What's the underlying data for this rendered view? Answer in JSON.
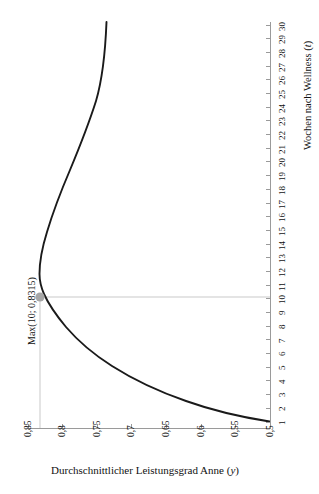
{
  "chart_data": {
    "type": "line",
    "title": "",
    "orientation": "rotated-90",
    "xlabel": "Wochen nach Wellness (t)",
    "ylabel": "Durchschnittlicher Leistungsgrad Anne (y)",
    "xlabel_plain": "Wochen nach Wellness",
    "xlabel_symbol": "t",
    "ylabel_plain": "Durchschnittlicher Leistungsgrad Anne",
    "ylabel_symbol": "y",
    "x": [
      1,
      2,
      3,
      4,
      5,
      6,
      7,
      8,
      9,
      10,
      11,
      12,
      13,
      14,
      15,
      16,
      17,
      18,
      19,
      20,
      21,
      22,
      23,
      24,
      25,
      26,
      27,
      28,
      29,
      30
    ],
    "xtick_labels": [
      "1",
      "2",
      "3",
      "4",
      "5",
      "6",
      "7",
      "8",
      "9",
      "10",
      "11",
      "12",
      "13",
      "14",
      "15",
      "16",
      "17",
      "18",
      "19",
      "20",
      "21",
      "22",
      "23",
      "24",
      "25",
      "26",
      "27",
      "28",
      "29",
      "30"
    ],
    "values": [
      0.5035,
      0.5405,
      0.572,
      0.599,
      0.6225,
      0.643,
      0.661,
      0.677,
      0.6915,
      0.8315,
      0.716,
      0.727,
      0.737,
      0.746,
      0.7545,
      0.7625,
      0.77,
      0.777,
      0.7835,
      0.79,
      0.796,
      0.8015,
      0.807,
      0.812,
      0.817,
      0.822,
      0.8265,
      0.831,
      0.835,
      0.839
    ],
    "ytick_labels": [
      "0,85",
      "0,8",
      "0,75",
      "0,7",
      "0,65",
      "0,6",
      "0,55",
      "0,5"
    ],
    "ytick_values": [
      0.85,
      0.8,
      0.75,
      0.7,
      0.65,
      0.6,
      0.55,
      0.5
    ],
    "ylim": [
      0.5,
      0.85
    ],
    "xlim": [
      1,
      30
    ],
    "grid": false,
    "legend": "none",
    "annotations": [
      {
        "name": "max-point",
        "label": "Max(10; 0,8315)",
        "x": 10,
        "y": 0.8315,
        "marker_color": "#a6a6a6",
        "guide_color": "#c9c9c9"
      }
    ],
    "series_color": "#1a1a1a",
    "axis_color": "#9a9a9a"
  }
}
